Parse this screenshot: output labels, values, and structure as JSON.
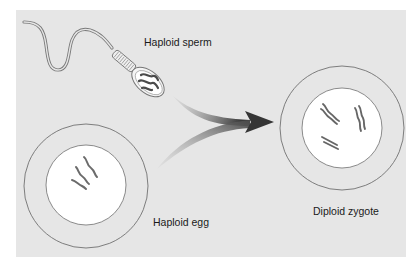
{
  "diagram": {
    "colors": {
      "panel": "#e6e6e6",
      "cell_outline": "#6f6f6f",
      "nucleus": "#ffffff",
      "chromosome": "#6b6b6b",
      "arrow_dark": "#3c3c3c",
      "arrow_light": "#9a9a9a"
    },
    "sperm": {
      "label": "Haploid sperm",
      "chromosome_count": 3
    },
    "egg": {
      "label": "Haploid egg",
      "chromosome_count": 3
    },
    "zygote": {
      "label": "Diploid zygote",
      "chromosome_pairs": 3
    },
    "arrow": {
      "meaning": "fusion of sperm and egg into zygote",
      "icon": "merge-arrow-icon"
    }
  }
}
